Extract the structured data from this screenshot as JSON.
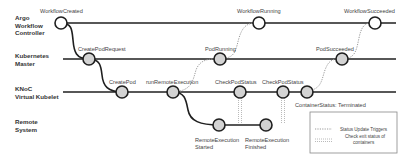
{
  "diagram": {
    "type": "swimlane-sequence",
    "lanes": [
      {
        "id": "argo",
        "label_lines": [
          "Argo",
          "Workflow",
          "Controller"
        ]
      },
      {
        "id": "k8s",
        "label_lines": [
          "Kubernetes",
          "Master"
        ]
      },
      {
        "id": "knoc",
        "label_lines": [
          "KNoC",
          "Virtual Kubelet"
        ]
      },
      {
        "id": "remote",
        "label_lines": [
          "Remote",
          "System"
        ]
      }
    ],
    "nodes": {
      "workflow_created": {
        "label": "WorkflowCreated",
        "lane": "argo",
        "style": "open"
      },
      "workflow_running": {
        "label": "WorkflowRunning",
        "lane": "argo",
        "style": "open"
      },
      "workflow_succeeded": {
        "label": "WorkflowSucceeded",
        "lane": "argo",
        "style": "open"
      },
      "create_pod_request": {
        "label": "CreatePodRequest",
        "lane": "k8s",
        "style": "filled"
      },
      "pod_running": {
        "label": "PodRunning",
        "lane": "k8s",
        "style": "filled"
      },
      "pod_succeeded": {
        "label": "PodSucceeded",
        "lane": "k8s",
        "style": "filled"
      },
      "create_pod": {
        "label": "CreatePod",
        "lane": "knoc",
        "style": "filled"
      },
      "run_remote_execution": {
        "label": "runRemoteExecution",
        "lane": "knoc",
        "style": "filled"
      },
      "check_pod_status_1": {
        "label": "CheckPodStatus",
        "lane": "knoc",
        "style": "filled"
      },
      "check_pod_status_2": {
        "label": "CheckPodStatus",
        "lane": "knoc",
        "style": "filled"
      },
      "container_status": {
        "label": "ContainerStatus: Terminated",
        "lane": "knoc",
        "style": "filled"
      },
      "remote_execution_started": {
        "label_lines": [
          "RemoteExecution",
          "Started"
        ],
        "lane": "remote",
        "style": "filled"
      },
      "remote_execution_finished": {
        "label_lines": [
          "RemoteExecution",
          "Finished"
        ],
        "lane": "remote",
        "style": "filled"
      }
    },
    "edges": [
      {
        "from": "workflow_created",
        "to": "create_pod_request",
        "kind": "flow"
      },
      {
        "from": "create_pod_request",
        "to": "create_pod",
        "kind": "flow"
      },
      {
        "from": "run_remote_execution",
        "to": "remote_execution_started",
        "kind": "flow"
      },
      {
        "from": "remote_execution_started",
        "to": "remote_execution_finished",
        "kind": "flow"
      },
      {
        "from": "run_remote_execution",
        "to": "pod_running",
        "kind": "status-update-trigger"
      },
      {
        "from": "pod_running",
        "to": "workflow_running",
        "kind": "status-update-trigger"
      },
      {
        "from": "container_status",
        "to": "pod_succeeded",
        "kind": "status-update-trigger"
      },
      {
        "from": "pod_succeeded",
        "to": "workflow_succeeded",
        "kind": "status-update-trigger"
      },
      {
        "from": "check_pod_status_1",
        "to": "remote_execution_started",
        "kind": "check-exit-status"
      },
      {
        "from": "check_pod_status_2",
        "to": "remote_execution_finished",
        "kind": "check-exit-status"
      }
    ],
    "legend": {
      "items": [
        {
          "style": "status-update-trigger",
          "label_lines": [
            "Status Update Triggers"
          ]
        },
        {
          "style": "check-exit-status",
          "label_lines": [
            "Check exit status of",
            "containers"
          ]
        }
      ]
    },
    "colors": {
      "line": "#1f1f1f",
      "node_fill": "#d3d3d3",
      "open_node_fill": "#ffffff",
      "dotted": "#9a9a9a",
      "text": "#444444"
    }
  }
}
